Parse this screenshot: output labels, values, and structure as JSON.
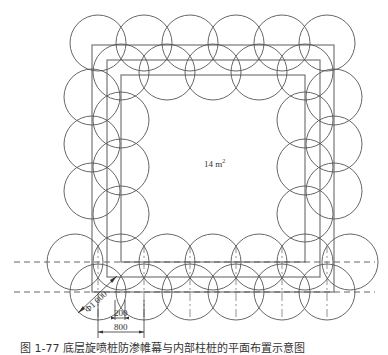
{
  "diagram": {
    "area_label": "14 m",
    "area_unit_sup": "2",
    "diameter_label": "Φ1 000",
    "dim_overlap": "200",
    "dim_spacing": "800",
    "caption": "图 1-77  底层旋喷桩防渗帷幕与内部柱桩的平面布置示意图"
  },
  "geometry": {
    "circle_radius": 28,
    "rectangles": [
      {
        "x": 92,
        "y": 45,
        "w": 242,
        "h": 247
      },
      {
        "x": 107,
        "y": 60,
        "w": 213,
        "h": 217
      },
      {
        "x": 121,
        "y": 75,
        "w": 184,
        "h": 187
      }
    ],
    "circles": [
      [
        98,
        43
      ],
      [
        144,
        43
      ],
      [
        190,
        43
      ],
      [
        236,
        43
      ],
      [
        282,
        43
      ],
      [
        327,
        43
      ],
      [
        121,
        72
      ],
      [
        167,
        72
      ],
      [
        213,
        72
      ],
      [
        259,
        72
      ],
      [
        305,
        72
      ],
      [
        92,
        97
      ],
      [
        92,
        144
      ],
      [
        92,
        191
      ],
      [
        121,
        120
      ],
      [
        121,
        167
      ],
      [
        121,
        214
      ],
      [
        334,
        97
      ],
      [
        334,
        144
      ],
      [
        334,
        191
      ],
      [
        305,
        120
      ],
      [
        305,
        167
      ],
      [
        305,
        214
      ],
      [
        75,
        262
      ],
      [
        121,
        262
      ],
      [
        167,
        262
      ],
      [
        213,
        262
      ],
      [
        259,
        262
      ],
      [
        305,
        262
      ],
      [
        350,
        262
      ],
      [
        98,
        292
      ],
      [
        144,
        292
      ],
      [
        190,
        292
      ],
      [
        236,
        292
      ],
      [
        282,
        292
      ],
      [
        327,
        292
      ]
    ]
  }
}
